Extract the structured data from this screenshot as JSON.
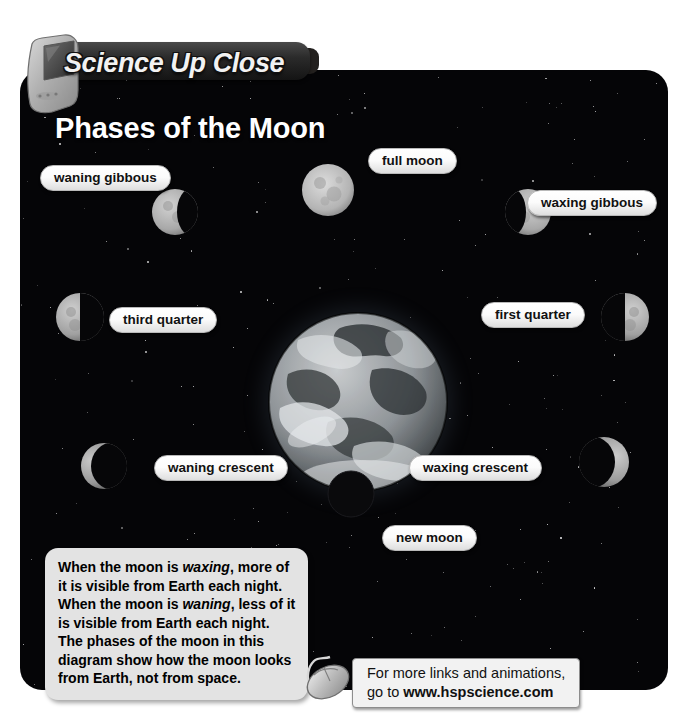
{
  "banner": {
    "title": "Science Up Close",
    "monitor_icon": "computer-monitor-icon"
  },
  "headline": "Phases of the Moon",
  "diagram": {
    "center_body": "Earth",
    "labels": [
      {
        "id": "waning-gibbous",
        "text": "waning gibbous"
      },
      {
        "id": "full-moon",
        "text": "full moon"
      },
      {
        "id": "waxing-gibbous",
        "text": "waxing gibbous"
      },
      {
        "id": "third-quarter",
        "text": "third quarter"
      },
      {
        "id": "first-quarter",
        "text": "first quarter"
      },
      {
        "id": "waning-crescent",
        "text": "waning crescent"
      },
      {
        "id": "waxing-crescent",
        "text": "waxing crescent"
      },
      {
        "id": "new-moon",
        "text": "new moon"
      }
    ]
  },
  "callout": {
    "line1": "When the moon is ",
    "em1": "waxing",
    "line2": ", more of it is visible from Earth each night. When the moon is ",
    "em2": "waning",
    "line3": ", less of it is visible from Earth each night. The phases of the moon in this diagram show how the moon looks from Earth, not from space."
  },
  "footer": {
    "line1": "For more links and animations,",
    "line2_prefix": "go to ",
    "url": "www.hspscience.com",
    "mouse_icon": "computer-mouse-icon"
  },
  "colors": {
    "panel_bg": "#050507",
    "pill_bg": "#ffffff",
    "callout_bg": "#e3e3e3",
    "title_text": "#ffffff"
  }
}
